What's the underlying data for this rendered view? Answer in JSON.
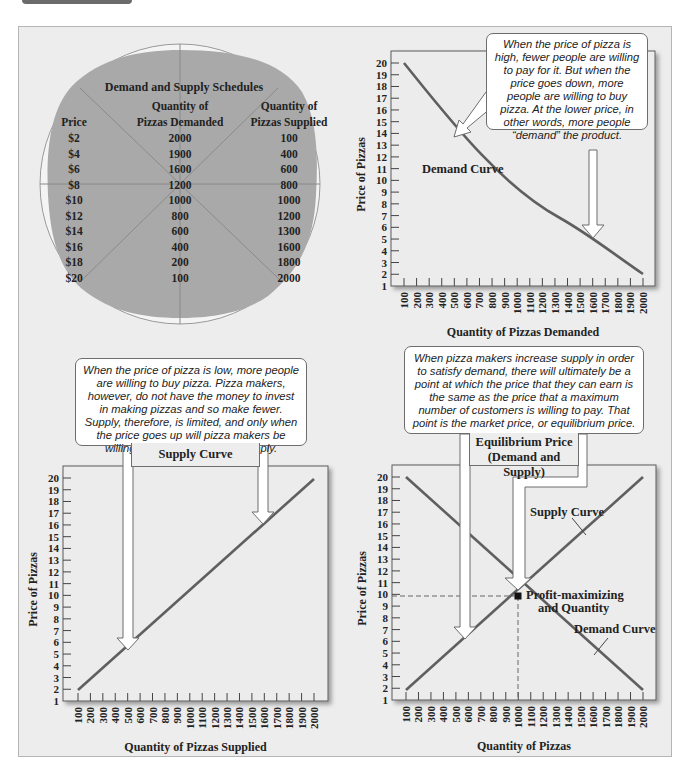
{
  "schedule": {
    "title": "Demand and Supply Schedules",
    "col_price": "Price",
    "col_demanded": "Quantity of\nPizzas Demanded",
    "col_demanded_l1": "Quantity of",
    "col_demanded_l2": "Pizzas Demanded",
    "col_supplied_l1": "Quantity of",
    "col_supplied_l2": "Pizzas Supplied",
    "rows": [
      {
        "price": "$2",
        "demanded": "2000",
        "supplied": "100"
      },
      {
        "price": "$4",
        "demanded": "1900",
        "supplied": "400"
      },
      {
        "price": "$6",
        "demanded": "1600",
        "supplied": "600"
      },
      {
        "price": "$8",
        "demanded": "1200",
        "supplied": "800"
      },
      {
        "price": "$10",
        "demanded": "1000",
        "supplied": "1000"
      },
      {
        "price": "$12",
        "demanded": "800",
        "supplied": "1200"
      },
      {
        "price": "$14",
        "demanded": "600",
        "supplied": "1300"
      },
      {
        "price": "$16",
        "demanded": "400",
        "supplied": "1600"
      },
      {
        "price": "$18",
        "demanded": "200",
        "supplied": "1800"
      },
      {
        "price": "$20",
        "demanded": "100",
        "supplied": "2000"
      }
    ]
  },
  "callouts": {
    "demand": "When the price of pizza is high, fewer people are willing to pay for it. But when the price goes down, more people are willing to buy pizza. At the lower price, in other words, more people “demand” the product.",
    "supply": "When the price of pizza is low, more people are willing to buy pizza. Pizza makers, however, do not have the money to invest in making pizzas and so make fewer. Supply, therefore, is limited, and only when the price goes up will pizza makers be willing and able to increase supply.",
    "equilibrium": "When pizza makers increase supply in order to satisfy demand, there will ultimately be a point at which the price that they can earn is the same as the price that a maximum number of customers is willing to pay. That point is the market price, or equilibrium price."
  },
  "labels": {
    "supply_curve_box": "Supply Curve",
    "equilibrium_box_l1": "Equilibrium Price",
    "equilibrium_box_l2": "(Demand and Supply)"
  },
  "colors": {
    "panel_bg": "#ededed",
    "pizza_fill": "#a9a9a9",
    "curve": "#5f5f5f",
    "callout_border": "#6d6d6d"
  },
  "chart_data": [
    {
      "type": "line",
      "title": "Demand Curve",
      "xlabel": "Quantity of Pizzas Demanded",
      "ylabel": "Price of Pizzas",
      "x_ticks": [
        100,
        200,
        300,
        400,
        500,
        600,
        700,
        800,
        900,
        1000,
        1100,
        1200,
        1300,
        1400,
        1500,
        1600,
        1700,
        1800,
        1900,
        2000
      ],
      "y_ticks": [
        1,
        2,
        3,
        4,
        5,
        6,
        7,
        8,
        9,
        10,
        11,
        12,
        13,
        14,
        15,
        16,
        17,
        18,
        19,
        20
      ],
      "ylim": [
        1,
        20
      ],
      "xlim": [
        100,
        2000
      ],
      "grid": false,
      "series": [
        {
          "name": "Demand Curve",
          "x": [
            100,
            400,
            600,
            1000,
            1200,
            1600,
            2000
          ],
          "y": [
            20,
            16.5,
            14,
            10.5,
            9,
            5.5,
            2
          ]
        }
      ],
      "annotations": [
        "Demand Curve"
      ]
    },
    {
      "type": "line",
      "title": "Supply Curve",
      "xlabel": "Quantity of Pizzas Supplied",
      "ylabel": "Price of Pizzas",
      "x_ticks": [
        100,
        200,
        300,
        400,
        500,
        600,
        700,
        800,
        900,
        1000,
        1100,
        1200,
        1300,
        1400,
        1500,
        1600,
        1700,
        1800,
        1900,
        2000
      ],
      "y_ticks": [
        1,
        2,
        3,
        4,
        5,
        6,
        7,
        8,
        9,
        10,
        11,
        12,
        13,
        14,
        15,
        16,
        17,
        18,
        19,
        20
      ],
      "ylim": [
        1,
        20
      ],
      "xlim": [
        100,
        2000
      ],
      "grid": false,
      "series": [
        {
          "name": "Supply Curve",
          "x": [
            100,
            2000
          ],
          "y": [
            2,
            20
          ]
        }
      ]
    },
    {
      "type": "line",
      "title": "Equilibrium Price (Demand and Supply)",
      "xlabel": "Quantity of Pizzas",
      "ylabel": "Price of Pizzas",
      "x_ticks": [
        100,
        200,
        300,
        400,
        500,
        600,
        700,
        800,
        900,
        1000,
        1100,
        1200,
        1300,
        1400,
        1500,
        1600,
        1700,
        1800,
        1900,
        2000
      ],
      "y_ticks": [
        1,
        2,
        3,
        4,
        5,
        6,
        7,
        8,
        9,
        10,
        11,
        12,
        13,
        14,
        15,
        16,
        17,
        18,
        19,
        20
      ],
      "ylim": [
        1,
        20
      ],
      "xlim": [
        100,
        2000
      ],
      "grid": false,
      "series": [
        {
          "name": "Supply Curve",
          "x": [
            100,
            2000
          ],
          "y": [
            2,
            20
          ]
        },
        {
          "name": "Demand Curve",
          "x": [
            100,
            2000
          ],
          "y": [
            20,
            2
          ]
        }
      ],
      "equilibrium_point": {
        "x": 1000,
        "y": 10
      },
      "annotations": [
        "Supply Curve",
        "Demand Curve",
        "Profit-maximizing and Quantity"
      ]
    }
  ]
}
